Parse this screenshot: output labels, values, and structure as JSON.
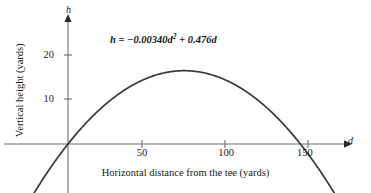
{
  "figure": {
    "title": "",
    "equation": {
      "lhs": "h",
      "equals": " = ",
      "coef_quadratic": "−0.00340",
      "var_quadratic": "d",
      "exponent": "2",
      "plus": " + ",
      "coef_linear": "0.476",
      "var_linear": "d",
      "full_text": "h = −0.00340d² + 0.476d"
    },
    "axes": {
      "x_variable": "d",
      "y_variable": "h",
      "x_caption": "Horizontal distance from the tee (yards)",
      "y_caption": "Vertical height (yards)"
    },
    "colors": {
      "curve": "#3a3a3a",
      "axis": "#6e6e6e",
      "text": "#1a1a1a",
      "background": "#ffffff"
    }
  },
  "chart_data": {
    "type": "line",
    "title": "",
    "subtitle": "",
    "xlabel": "Horizontal distance from the tee (yards)",
    "ylabel": "Vertical height (yards)",
    "x_axis_symbol": "d",
    "y_axis_symbol": "h",
    "annotation": "h = −0.00340d² + 0.476d",
    "grid": false,
    "legend": false,
    "legend_position": "none",
    "xlim": [
      -22,
      168
    ],
    "ylim": [
      -11,
      25
    ],
    "xticks": [
      50,
      100,
      150
    ],
    "xtick_labels": [
      "50",
      "100",
      "150"
    ],
    "yticks": [
      10,
      20
    ],
    "ytick_labels": [
      "10",
      "20"
    ],
    "equation_coefficients": {
      "a": -0.0034,
      "b": 0.476,
      "c": 0
    },
    "vertex": {
      "d": 70.0,
      "h": 16.66
    },
    "roots": [
      0,
      140.0
    ],
    "series": [
      {
        "name": "h = −0.00340d² + 0.476d",
        "x": [
          -22,
          -15,
          -10,
          -5,
          0,
          10,
          20,
          30,
          40,
          50,
          60,
          70,
          80,
          90,
          100,
          110,
          120,
          130,
          140,
          150,
          158,
          165
        ],
        "values": [
          -12.12,
          -7.9,
          -5.1,
          -2.47,
          0,
          4.42,
          8.16,
          11.16,
          13.6,
          11.9,
          16.33,
          16.66,
          16.32,
          15.29,
          13.6,
          11.22,
          8.16,
          4.42,
          0,
          -5.1,
          -9.3,
          -12.0
        ]
      }
    ]
  }
}
